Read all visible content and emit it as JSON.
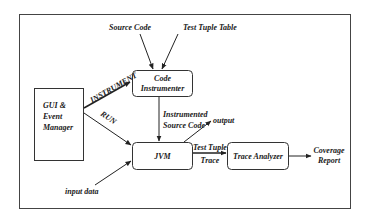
{
  "diagram": {
    "type": "flowchart",
    "nodes": {
      "gui": {
        "line1": "GUI &",
        "line2": "Event",
        "line3": "Manager"
      },
      "instrumenter": {
        "line1": "Code",
        "line2": "Instrumenter"
      },
      "jvm": {
        "label": "JVM"
      },
      "analyzer": {
        "label": "Trace Analyzer"
      }
    },
    "inputs": {
      "source_code": "Source Code",
      "test_tuple_table": "Test Tuple Table",
      "input_data": "input data"
    },
    "outputs": {
      "output": "output",
      "coverage_line1": "Coverage",
      "coverage_line2": "Report"
    },
    "edge_labels": {
      "instrument": "INSTRUMENT",
      "run": "RUN",
      "instrumented_line1": "Instrumented",
      "instrumented_line2": "Source Code",
      "trace_line1": "Test Tuple",
      "trace_line2": "Trace"
    },
    "edges": [
      {
        "from": "Source Code",
        "to": "Code Instrumenter"
      },
      {
        "from": "Test Tuple Table",
        "to": "Code Instrumenter"
      },
      {
        "from": "GUI & Event Manager",
        "to": "Code Instrumenter",
        "label": "INSTRUMENT"
      },
      {
        "from": "GUI & Event Manager",
        "to": "JVM",
        "label": "RUN"
      },
      {
        "from": "Code Instrumenter",
        "to": "JVM",
        "label": "Instrumented Source Code"
      },
      {
        "from": "JVM",
        "to": "output"
      },
      {
        "from": "input data",
        "to": "JVM"
      },
      {
        "from": "JVM",
        "to": "Trace Analyzer",
        "label": "Test Tuple Trace"
      },
      {
        "from": "Trace Analyzer",
        "to": "Coverage Report"
      }
    ],
    "colors": {
      "stroke": "#333333",
      "text": "#1a1a1a",
      "background": "#ffffff"
    }
  }
}
